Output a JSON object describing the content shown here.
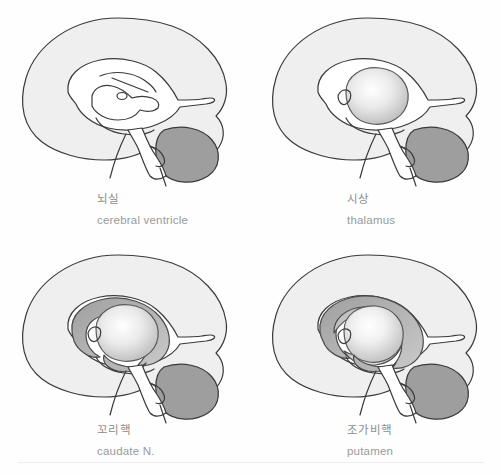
{
  "page": {
    "background_color": "#fefefe",
    "rule_color": "#ededed"
  },
  "palette": {
    "outline": "#3a3a3a",
    "cerebrum_fill": "#efefef",
    "cerebellum_fill": "#9e9e9e",
    "thalamus_light": "#ffffff",
    "thalamus_edge": "#b9b9b9",
    "caudate_fill": "#b5b5b5",
    "putamen_fill": "#c6c6c6",
    "ventricle_fill": "#ffffff",
    "label_ko_color": "#8d8d8d",
    "label_en_color": "#9a9a9a"
  },
  "panels": [
    {
      "id": "cerebral-ventricle",
      "position": "top-left",
      "label_ko": "뇌실",
      "label_en": "cerebral ventricle",
      "highlight": "ventricle",
      "shows_thalamus": false,
      "shows_caudate": false,
      "shows_putamen": false
    },
    {
      "id": "thalamus",
      "position": "top-right",
      "label_ko": "시상",
      "label_en": "thalamus",
      "highlight": "thalamus",
      "shows_thalamus": true,
      "shows_caudate": false,
      "shows_putamen": false
    },
    {
      "id": "caudate-nucleus",
      "position": "bottom-left",
      "label_ko": "꼬리핵",
      "label_en": "caudate N.",
      "highlight": "caudate",
      "shows_thalamus": true,
      "shows_caudate": true,
      "shows_putamen": false
    },
    {
      "id": "putamen",
      "position": "bottom-right",
      "label_ko": "조가비핵",
      "label_en": "putamen",
      "highlight": "putamen",
      "shows_thalamus": true,
      "shows_caudate": true,
      "shows_putamen": true
    }
  ]
}
